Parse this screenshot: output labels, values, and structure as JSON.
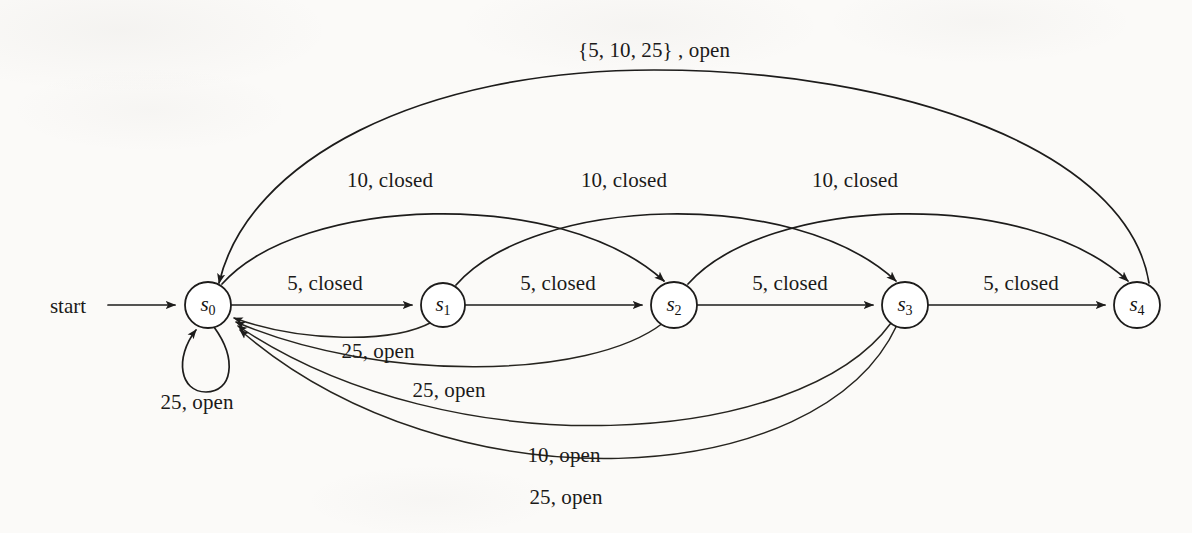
{
  "diagram": {
    "kind": "finite-state-machine",
    "title": "",
    "background_color": "#fbfaf8",
    "stroke_color": "#1d1c1b",
    "node_fill": "#ffffff",
    "start_label": "start",
    "states": [
      {
        "id": "s0",
        "label": "s",
        "sub": "0",
        "cx": 208,
        "cy": 305,
        "r": 23
      },
      {
        "id": "s1",
        "label": "s",
        "sub": "1",
        "cx": 443,
        "cy": 305,
        "r": 22
      },
      {
        "id": "s2",
        "label": "s",
        "sub": "2",
        "cx": 674,
        "cy": 305,
        "r": 23
      },
      {
        "id": "s3",
        "label": "s",
        "sub": "3",
        "cx": 905,
        "cy": 305,
        "r": 23
      },
      {
        "id": "s4",
        "label": "s",
        "sub": "4",
        "cx": 1137,
        "cy": 305,
        "r": 23
      }
    ],
    "transitions": [
      {
        "id": "t-s4-s0-top",
        "from": "s4",
        "to": "s0",
        "label": "{5, 10, 25} , open",
        "label_x": 654,
        "label_y": 50
      },
      {
        "id": "t-s0-s2",
        "from": "s0",
        "to": "s2",
        "label": "10, closed",
        "label_x": 390,
        "label_y": 180
      },
      {
        "id": "t-s1-s3",
        "from": "s1",
        "to": "s3",
        "label": "10, closed",
        "label_x": 624,
        "label_y": 180
      },
      {
        "id": "t-s2-s4",
        "from": "s2",
        "to": "s4",
        "label": "10, closed",
        "label_x": 855,
        "label_y": 180
      },
      {
        "id": "t-s0-s1",
        "from": "s0",
        "to": "s1",
        "label": "5, closed",
        "label_x": 325,
        "label_y": 283
      },
      {
        "id": "t-s1-s2",
        "from": "s1",
        "to": "s2",
        "label": "5, closed",
        "label_x": 558,
        "label_y": 283
      },
      {
        "id": "t-s2-s3",
        "from": "s2",
        "to": "s3",
        "label": "5, closed",
        "label_x": 790,
        "label_y": 283
      },
      {
        "id": "t-s3-s4",
        "from": "s3",
        "to": "s4",
        "label": "5, closed",
        "label_x": 1021,
        "label_y": 283
      },
      {
        "id": "t-s0-self",
        "from": "s0",
        "to": "s0",
        "label": "25, open",
        "label_x": 197,
        "label_y": 402
      },
      {
        "id": "t-s1-s0",
        "from": "s1",
        "to": "s0",
        "label": "25, open",
        "label_x": 378,
        "label_y": 351
      },
      {
        "id": "t-s2-s0",
        "from": "s2",
        "to": "s0",
        "label": "25, open",
        "label_x": 449,
        "label_y": 390
      },
      {
        "id": "t-s3-s0-10",
        "from": "s3",
        "to": "s0",
        "label": "10, open",
        "label_x": 564,
        "label_y": 455
      },
      {
        "id": "t-s3-s0-25",
        "from": "s3",
        "to": "s0",
        "label": "25, open",
        "label_x": 566,
        "label_y": 497
      }
    ]
  }
}
